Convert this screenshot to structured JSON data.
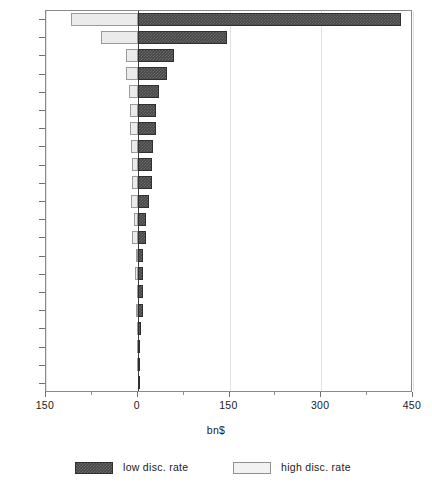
{
  "chart_data": {
    "type": "bar",
    "orientation": "horizontal",
    "title": "",
    "xlabel": "bn$",
    "ylabel": "",
    "xlim": [
      -150,
      450
    ],
    "xticks": [
      -150,
      0,
      150,
      300,
      450
    ],
    "xtick_labels": [
      "150",
      "0",
      "150",
      "300",
      "450"
    ],
    "grid": true,
    "legend_position": "bottom",
    "categories": [
      "US",
      "JAP",
      "UK",
      "ITA",
      "AUS",
      "FRA",
      "SPA",
      "SWE",
      "FRG",
      "NET",
      "DEN",
      "NZL",
      "FIN",
      "NOR",
      "GRE",
      "TUR",
      "CAN",
      "POR",
      "IRE",
      "ICE",
      "BEL"
    ],
    "series": [
      {
        "name": "low disc. rate",
        "color": "#464646",
        "values": [
          430,
          146,
          59,
          48,
          34,
          30,
          30,
          25,
          23,
          24,
          19,
          14,
          14,
          9,
          9,
          9,
          8,
          5,
          4,
          2,
          1
        ]
      },
      {
        "name": "high disc. rate",
        "color": "#ebebeb",
        "values": [
          -109,
          -60,
          -19,
          -19,
          -14,
          -13,
          -12,
          -11,
          -10,
          -10,
          -11,
          -6,
          -9,
          -3,
          -4,
          -2,
          -3,
          -2,
          -1,
          -1,
          0
        ]
      }
    ]
  },
  "axis": {
    "x_title": "bn$",
    "tick_labels": [
      "150",
      "0",
      "150",
      "300",
      "450"
    ],
    "category_labels": [
      "US",
      "JAP",
      "UK",
      "ITA",
      "AUS",
      "FRA",
      "SPA",
      "SWE",
      "FRG",
      "NET",
      "DEN",
      "NZL",
      "FIN",
      "NOR",
      "GRE",
      "TUR",
      "CAN",
      "POR",
      "IRE",
      "ICE",
      "BEL"
    ]
  },
  "legend": {
    "items": [
      {
        "label": "low disc. rate",
        "swatch": "low"
      },
      {
        "label": "high disc. rate",
        "swatch": "high"
      }
    ]
  }
}
